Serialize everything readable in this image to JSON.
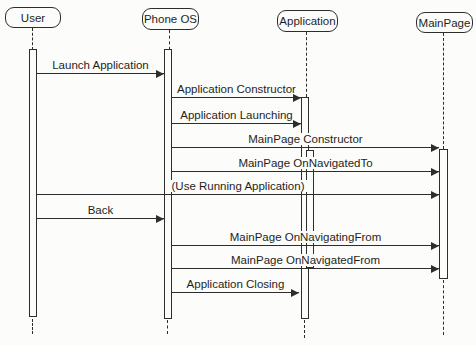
{
  "diagram": {
    "kind": "uml-sequence-diagram",
    "background_color": "#fcfcfa",
    "line_color": "#2d2d2d"
  },
  "actors": [
    {
      "name": "User"
    },
    {
      "name": "Phone OS"
    },
    {
      "name": "Application"
    },
    {
      "name": "MainPage"
    }
  ],
  "messages": [
    {
      "label": "Launch Application",
      "from": "User",
      "to": "Phone OS"
    },
    {
      "label": "Application Constructor",
      "from": "Phone OS",
      "to": "Application"
    },
    {
      "label": "Application Launching",
      "from": "Phone OS",
      "to": "Application"
    },
    {
      "label": "MainPage Constructor",
      "from": "Phone OS",
      "to": "MainPage"
    },
    {
      "label": "MainPage OnNavigatedTo",
      "from": "Phone OS",
      "to": "MainPage"
    },
    {
      "label": "(Use Running Application)",
      "from": "User",
      "to": "MainPage"
    },
    {
      "label": "Back",
      "from": "User",
      "to": "Phone OS"
    },
    {
      "label": "MainPage OnNavigatingFrom",
      "from": "Phone OS",
      "to": "MainPage"
    },
    {
      "label": "MainPage OnNavigatedFrom",
      "from": "Phone OS",
      "to": "MainPage"
    },
    {
      "label": "Application Closing",
      "from": "Phone OS",
      "to": "Application"
    }
  ]
}
